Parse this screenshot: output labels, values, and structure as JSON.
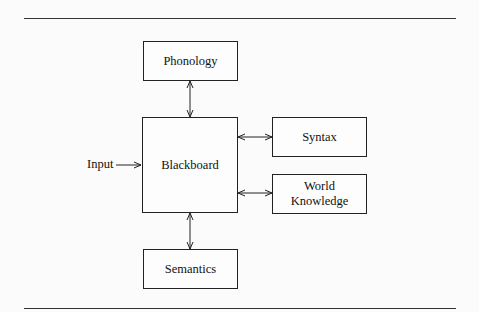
{
  "diagram": {
    "nodes": {
      "phonology": {
        "label": "Phonology"
      },
      "blackboard": {
        "label": "Blackboard"
      },
      "syntax": {
        "label": "Syntax"
      },
      "world_knowledge": {
        "label": "World Knowledge",
        "line1": "World",
        "line2": "Knowledge"
      },
      "semantics": {
        "label": "Semantics"
      }
    },
    "input_label": "Input",
    "edges": [
      {
        "from": "input",
        "to": "blackboard",
        "type": "one-way"
      },
      {
        "from": "phonology",
        "to": "blackboard",
        "type": "bidirectional"
      },
      {
        "from": "blackboard",
        "to": "syntax",
        "type": "bidirectional"
      },
      {
        "from": "blackboard",
        "to": "world_knowledge",
        "type": "bidirectional"
      },
      {
        "from": "blackboard",
        "to": "semantics",
        "type": "bidirectional"
      }
    ]
  }
}
